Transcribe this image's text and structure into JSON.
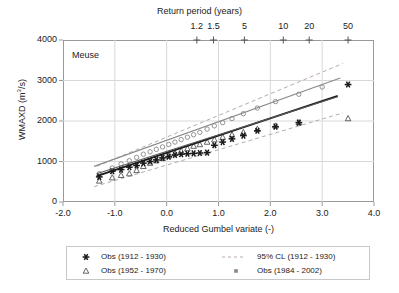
{
  "chart_data": {
    "type": "scatter",
    "title": "",
    "annotation": "Meuse",
    "xlabel": "Reduced Gumbel variate (-)",
    "ylabel": "WMAXD (m³/s)",
    "top_axis_label": "Return period (years)",
    "xlim": [
      -2.0,
      4.0
    ],
    "ylim": [
      0,
      4000
    ],
    "xticks": [
      "-2.0",
      "-1.0",
      "0.0",
      "1.0",
      "2.0",
      "3.0",
      "4.0"
    ],
    "xtick_values": [
      -2.0,
      -1.0,
      0.0,
      1.0,
      2.0,
      3.0,
      4.0
    ],
    "yticks": [
      "0",
      "1000",
      "2000",
      "3000",
      "4000"
    ],
    "ytick_values": [
      0,
      1000,
      2000,
      3000,
      4000
    ],
    "grid": true,
    "legend_position": "bottom",
    "return_period_ticks": [
      {
        "label": "1.2",
        "gumbel": 0.583
      },
      {
        "label": "1.5",
        "gumbel": 0.903
      },
      {
        "label": "5",
        "gumbel": 1.5
      },
      {
        "label": "10",
        "gumbel": 2.25
      },
      {
        "label": "20",
        "gumbel": 2.75
      },
      {
        "label": "50",
        "gumbel": 3.5
      }
    ],
    "series": [
      {
        "name": "Obs (1912 - 1930)",
        "marker": "star",
        "color": "#1a1a1a",
        "points": [
          [
            -1.3,
            620
          ],
          [
            -1.05,
            760
          ],
          [
            -0.88,
            800
          ],
          [
            -0.72,
            860
          ],
          [
            -0.58,
            900
          ],
          [
            -0.45,
            960
          ],
          [
            -0.32,
            1000
          ],
          [
            -0.2,
            1040
          ],
          [
            -0.08,
            1090
          ],
          [
            0.04,
            1120
          ],
          [
            0.16,
            1160
          ],
          [
            0.28,
            1180
          ],
          [
            0.4,
            1190
          ],
          [
            0.52,
            1200
          ],
          [
            0.64,
            1210
          ],
          [
            0.78,
            1220
          ],
          [
            0.92,
            1400
          ],
          [
            1.08,
            1480
          ],
          [
            1.26,
            1560
          ],
          [
            1.48,
            1640
          ],
          [
            1.75,
            1760
          ],
          [
            2.1,
            1860
          ],
          [
            2.55,
            1960
          ],
          [
            3.5,
            2900
          ]
        ]
      },
      {
        "name": "Obs (1952 - 1970)",
        "marker": "triangle",
        "color": "#555555",
        "points": [
          [
            -1.3,
            520
          ],
          [
            -1.05,
            600
          ],
          [
            -0.88,
            660
          ],
          [
            -0.72,
            700
          ],
          [
            -0.58,
            780
          ],
          [
            -0.45,
            880
          ],
          [
            -0.32,
            960
          ],
          [
            -0.2,
            1020
          ],
          [
            -0.08,
            1080
          ],
          [
            0.04,
            1140
          ],
          [
            0.16,
            1200
          ],
          [
            0.28,
            1260
          ],
          [
            0.4,
            1320
          ],
          [
            0.52,
            1380
          ],
          [
            0.64,
            1420
          ],
          [
            0.78,
            1480
          ],
          [
            0.92,
            1540
          ],
          [
            1.08,
            1600
          ],
          [
            1.26,
            1660
          ],
          [
            1.48,
            1720
          ],
          [
            1.75,
            1800
          ],
          [
            2.1,
            1880
          ],
          [
            2.55,
            1960
          ],
          [
            3.5,
            2060
          ]
        ]
      },
      {
        "name": "Obs (1984 - 2002)",
        "marker": "circle",
        "color": "#888888",
        "points": [
          [
            -1.3,
            700
          ],
          [
            -1.05,
            840
          ],
          [
            -0.88,
            940
          ],
          [
            -0.72,
            1020
          ],
          [
            -0.58,
            1100
          ],
          [
            -0.45,
            1180
          ],
          [
            -0.32,
            1240
          ],
          [
            -0.2,
            1300
          ],
          [
            -0.08,
            1360
          ],
          [
            0.04,
            1420
          ],
          [
            0.16,
            1480
          ],
          [
            0.28,
            1540
          ],
          [
            0.4,
            1600
          ],
          [
            0.52,
            1660
          ],
          [
            0.64,
            1720
          ],
          [
            0.78,
            1800
          ],
          [
            0.92,
            1880
          ],
          [
            1.08,
            1960
          ],
          [
            1.26,
            2060
          ],
          [
            1.48,
            2180
          ],
          [
            1.75,
            2320
          ],
          [
            2.1,
            2480
          ],
          [
            2.55,
            2660
          ],
          [
            3.0,
            2840
          ]
        ]
      }
    ],
    "fit_lines": [
      {
        "name": "Fit (1912 - 1930)",
        "color": "#1a1a1a",
        "width": 1.9,
        "x0": -1.35,
        "y0": 640,
        "x1": 3.3,
        "y1": 2620
      },
      {
        "name": "Fit (1952 - 1970)",
        "color": "#5a5a5a",
        "width": 1.1,
        "x0": -1.35,
        "y0": 700,
        "x1": 3.3,
        "y1": 2600
      },
      {
        "name": "Fit (1984 - 2002)",
        "color": "#8a8a8a",
        "width": 1.1,
        "x0": -1.4,
        "y0": 880,
        "x1": 3.35,
        "y1": 3060
      }
    ],
    "confidence_bands": [
      {
        "name": "95% CL (1912 - 1930) upper",
        "color": "#b0a0a8",
        "x0": -1.35,
        "y0": 880,
        "x1": 3.4,
        "y1": 3420
      },
      {
        "name": "95% CL (1912 - 1930) lower",
        "color": "#b0a0a8",
        "x0": -1.4,
        "y0": 380,
        "x1": 3.4,
        "y1": 2200
      }
    ]
  },
  "legend": {
    "entries": [
      {
        "label": "Obs (1912 - 1930)",
        "symbol": "star"
      },
      {
        "label": "95% CL (1912 - 1930)",
        "symbol": "dashed-line"
      },
      {
        "label": "Obs (1952 - 1970)",
        "symbol": "triangle"
      },
      {
        "label": "Obs (1984 - 2002)",
        "symbol": "square"
      }
    ]
  },
  "axis_title": {
    "top": "Return period (years)",
    "bottom": "Reduced Gumbel variate (-)",
    "left_prefix": "WMAXD (m",
    "left_sup": "3",
    "left_suffix": "/s)"
  },
  "annotation": {
    "basin": "Meuse"
  },
  "colors": {
    "frame": "#9a9a9a",
    "grid": "#d8d8d8",
    "text": "#222222",
    "series1": "#1a1a1a",
    "series2": "#555555",
    "series3": "#888888",
    "cl": "#b0a0a8"
  }
}
